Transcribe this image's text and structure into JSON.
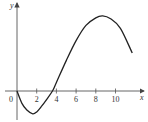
{
  "chart_data": {
    "type": "line",
    "title": "",
    "xlabel": "x",
    "ylabel": "y",
    "origin_label": "0",
    "x_ticks": [
      2,
      4,
      6,
      8,
      10
    ],
    "x_tick_labels": [
      "2",
      "4",
      "6",
      "8",
      "10"
    ],
    "xlim": [
      0,
      12.4
    ],
    "y_ticks": [],
    "grid": false,
    "legend": null,
    "series": [
      {
        "name": "y",
        "x": [
          0,
          0.5,
          1,
          1.6,
          2,
          2.5,
          3,
          3.6,
          4,
          5,
          6,
          7,
          8,
          8.7,
          9.5,
          10.5,
          11.7
        ],
        "y": [
          0,
          -1.3,
          -2.0,
          -2.4,
          -2.2,
          -1.6,
          -0.9,
          0,
          0.9,
          3.2,
          5.3,
          6.9,
          7.7,
          7.9,
          7.6,
          6.6,
          4.0
        ]
      }
    ]
  },
  "axes": {
    "x_label": "x",
    "y_label": "y",
    "origin": "0"
  }
}
